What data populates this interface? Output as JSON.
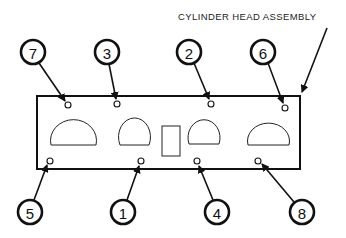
{
  "diagram": {
    "title_label": "CYLINDER HEAD ASSEMBLY",
    "callouts_top": [
      {
        "number": "7",
        "cx": 33,
        "cy": 52,
        "hole": [
          68,
          105
        ]
      },
      {
        "number": "3",
        "cx": 107,
        "cy": 52,
        "hole": [
          117,
          104
        ]
      },
      {
        "number": "2",
        "cx": 189,
        "cy": 52,
        "hole": [
          211,
          104
        ]
      },
      {
        "number": "6",
        "cx": 263,
        "cy": 52,
        "hole": [
          285,
          108
        ]
      }
    ],
    "callouts_bottom": [
      {
        "number": "5",
        "cx": 30,
        "cy": 212,
        "hole": [
          50,
          161
        ]
      },
      {
        "number": "1",
        "cx": 123,
        "cy": 212,
        "hole": [
          141,
          161
        ]
      },
      {
        "number": "4",
        "cx": 217,
        "cy": 212,
        "hole": [
          197,
          161
        ]
      },
      {
        "number": "8",
        "cx": 302,
        "cy": 212,
        "hole": [
          258,
          161
        ]
      }
    ],
    "tightening_sequence": [
      "1",
      "2",
      "3",
      "4",
      "5",
      "6",
      "7",
      "8"
    ]
  }
}
